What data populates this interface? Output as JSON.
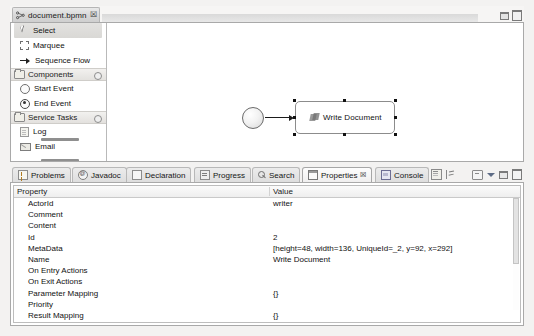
{
  "editor": {
    "tab": {
      "label": "document.bpmn",
      "close": "☒",
      "icon": "bpmn-file-icon"
    },
    "window_buttons": {
      "minimize": "minimize-icon",
      "maximize": "maximize-icon"
    },
    "palette": {
      "tools": [
        {
          "label": "Select",
          "icon": "cursor-icon",
          "selected": true
        },
        {
          "label": "Marquee",
          "icon": "marquee-icon",
          "selected": false
        },
        {
          "label": "Sequence Flow",
          "icon": "arrow-right-icon",
          "selected": false
        }
      ],
      "groups": [
        {
          "label": "Components",
          "icon": "folder-icon",
          "collapse": "collapse-icon",
          "items": [
            {
              "label": "Start Event",
              "icon": "start-event-icon"
            },
            {
              "label": "End Event",
              "icon": "end-event-icon"
            }
          ]
        },
        {
          "label": "Service Tasks",
          "icon": "folder-icon",
          "collapse": "collapse-icon",
          "items": [
            {
              "label": "Log",
              "icon": "log-document-icon"
            },
            {
              "label": "Email",
              "icon": "email-icon"
            }
          ]
        }
      ]
    },
    "canvas": {
      "start_event": "start-event-node",
      "sequence_flow": "sequence-flow-connection",
      "task": {
        "label": "Write Document",
        "icon": "service-task-icon",
        "selected": true
      }
    }
  },
  "views": {
    "tabs": [
      {
        "label": "Problems",
        "icon": "problems-icon",
        "active": false
      },
      {
        "label": "Javadoc",
        "icon": "javadoc-icon",
        "active": false
      },
      {
        "label": "Declaration",
        "icon": "declaration-icon",
        "active": false
      },
      {
        "label": "Progress",
        "icon": "progress-icon",
        "active": false
      },
      {
        "label": "Search",
        "icon": "search-icon",
        "active": false
      },
      {
        "label": "Properties",
        "icon": "properties-icon",
        "active": true,
        "close": "☒"
      },
      {
        "label": "Console",
        "icon": "console-icon",
        "active": false
      }
    ],
    "toolbar": [
      {
        "icon": "filter-icon"
      },
      {
        "icon": "pin-icon"
      },
      {
        "icon": "view-menu-icon"
      },
      {
        "icon": "chevron-down-icon"
      },
      {
        "icon": "minimize-icon"
      },
      {
        "icon": "maximize-icon"
      }
    ]
  },
  "properties_table": {
    "columns": [
      "Property",
      "Value"
    ],
    "rows": [
      {
        "property": "ActorId",
        "value": "writer"
      },
      {
        "property": "Comment",
        "value": ""
      },
      {
        "property": "Content",
        "value": ""
      },
      {
        "property": "Id",
        "value": "2"
      },
      {
        "property": "MetaData",
        "value": "[height=48, width=136, UniqueId=_2, y=92, x=292]"
      },
      {
        "property": "Name",
        "value": "Write Document"
      },
      {
        "property": "On Entry Actions",
        "value": ""
      },
      {
        "property": "On Exit Actions",
        "value": ""
      },
      {
        "property": "Parameter Mapping",
        "value": "{}"
      },
      {
        "property": "Priority",
        "value": ""
      },
      {
        "property": "Result Mapping",
        "value": "{}"
      },
      {
        "property": "Skippable",
        "value": ""
      }
    ]
  },
  "colors": {
    "window_bg": "#f3f2f1",
    "panel_border": "#a9a9a9",
    "tab_active": "#fdfdfd",
    "text": "#111111",
    "node_border": "#8c8c8c",
    "scrollbar": "#bdbdbd"
  }
}
